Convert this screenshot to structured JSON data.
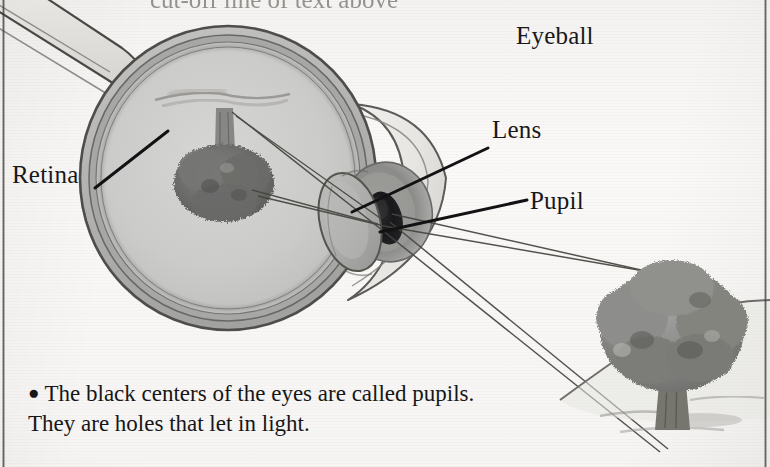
{
  "page": {
    "width": 770,
    "height": 467,
    "background_color": "#f7f6f4",
    "ink_color": "#18181a",
    "source_type": "scanned-textbook-page"
  },
  "top_cut_text": "cut-off line of text above",
  "labels": {
    "eyeball": "Eyeball",
    "lens": "Lens",
    "pupil": "Pupil",
    "retina": "Retina"
  },
  "caption": {
    "bullet": "●",
    "text": "The black centers of the eyes are called pupils. They are holes that let in light."
  },
  "diagram": {
    "title": "Eyeball",
    "type": "cross-section anatomical illustration",
    "parts": [
      {
        "name": "sclera",
        "label": "",
        "fill": "#b8b8b6"
      },
      {
        "name": "choroid",
        "label": "",
        "fill": "#9a9a98"
      },
      {
        "name": "retina",
        "label": "Retina",
        "fill": "#c6c6c4"
      },
      {
        "name": "vitreous-body",
        "label": "",
        "fill": "#cacac8"
      },
      {
        "name": "lens",
        "label": "Lens",
        "fill": "#aeaeac"
      },
      {
        "name": "pupil",
        "label": "Pupil",
        "fill": "#1d1d1f"
      },
      {
        "name": "iris",
        "label": "",
        "fill": "#8e8e8c"
      },
      {
        "name": "cornea",
        "label": "",
        "fill": "#e6e5e3"
      },
      {
        "name": "optic-nerve",
        "label": "",
        "fill": "#dcdbd8"
      },
      {
        "name": "retinal-image",
        "label": "",
        "fill": "#6e6e6c"
      }
    ],
    "light_rays": {
      "count": 4,
      "description": "rays from top of tree and base of trunk converging through the pupil and lens onto the retina, forming an inverted image",
      "color": "#3c3a38"
    },
    "object_viewed": {
      "name": "tree",
      "description": "broadleaf tree on a ground slope",
      "foliage_color": "#8b8b89",
      "trunk_color": "#6f6f6d",
      "ground_color": "#c4c3c0"
    }
  }
}
